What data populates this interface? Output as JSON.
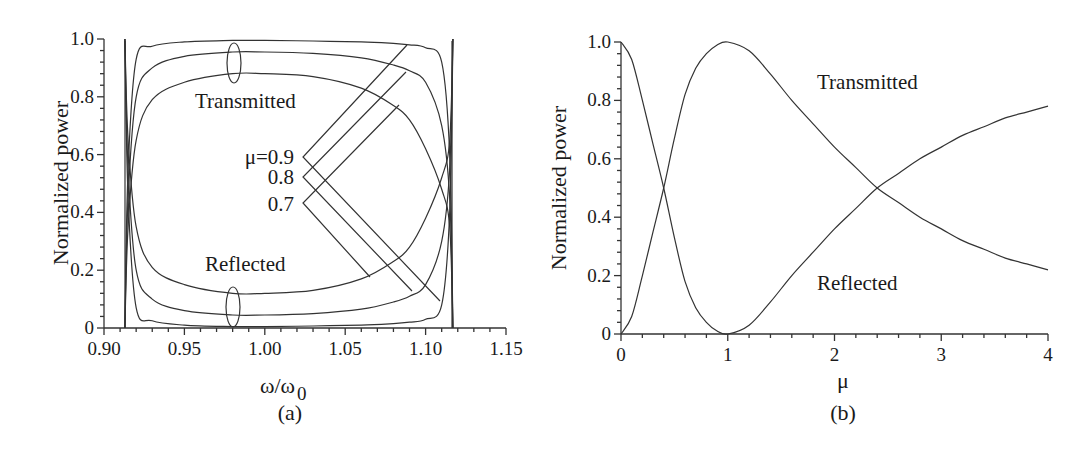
{
  "figure": {
    "panel_a": {
      "caption": "(a)",
      "ylabel": "Normalized power",
      "xlabel_main": "ω/ω",
      "xlabel_sub": "0",
      "xticks": [
        "0.90",
        "0.95",
        "1.00",
        "1.05",
        "1.10",
        "1.15"
      ],
      "yticks": [
        "0",
        "0.2",
        "0.4",
        "0.6",
        "0.8",
        "1.0"
      ],
      "annotations": {
        "transmitted": "Transmitted",
        "reflected": "Reflected",
        "mu_09": "μ=0.9",
        "mu_08": "0.8",
        "mu_07": "0.7"
      }
    },
    "panel_b": {
      "caption": "(b)",
      "ylabel": "Normalized power",
      "xlabel": "μ",
      "xticks": [
        "0",
        "1",
        "2",
        "3",
        "4"
      ],
      "yticks": [
        "0",
        "0.2",
        "0.4",
        "0.6",
        "0.8",
        "1.0"
      ],
      "annotations": {
        "transmitted": "Transmitted",
        "reflected": "Reflected"
      }
    }
  },
  "chart_data": [
    {
      "type": "line",
      "panel": "(a)",
      "title": "",
      "xlabel": "ω/ω0",
      "ylabel": "Normalized power",
      "xlim": [
        0.9,
        1.15
      ],
      "ylim": [
        0,
        1.0
      ],
      "grid": false,
      "x": [
        0.913,
        0.915,
        0.92,
        0.93,
        0.95,
        0.98,
        1.0,
        1.03,
        1.06,
        1.08,
        1.09,
        1.1,
        1.11,
        1.115,
        1.117
      ],
      "series": [
        {
          "name": "Transmitted μ=0.9",
          "values": [
            0.0,
            0.55,
            0.93,
            0.975,
            0.99,
            0.995,
            0.995,
            0.993,
            0.99,
            0.985,
            0.98,
            0.97,
            0.92,
            0.6,
            0.0
          ]
        },
        {
          "name": "Transmitted μ=0.8",
          "values": [
            0.0,
            0.45,
            0.8,
            0.9,
            0.94,
            0.955,
            0.955,
            0.95,
            0.935,
            0.91,
            0.89,
            0.85,
            0.7,
            0.45,
            0.0
          ]
        },
        {
          "name": "Transmitted μ=0.7",
          "values": [
            0.0,
            0.35,
            0.65,
            0.79,
            0.85,
            0.88,
            0.88,
            0.87,
            0.83,
            0.77,
            0.72,
            0.62,
            0.48,
            0.35,
            0.0
          ]
        },
        {
          "name": "Reflected μ=0.9",
          "values": [
            1.0,
            0.45,
            0.07,
            0.025,
            0.01,
            0.005,
            0.005,
            0.007,
            0.01,
            0.015,
            0.02,
            0.03,
            0.08,
            0.4,
            1.0
          ]
        },
        {
          "name": "Reflected μ=0.8",
          "values": [
            1.0,
            0.55,
            0.2,
            0.1,
            0.06,
            0.045,
            0.045,
            0.05,
            0.065,
            0.09,
            0.11,
            0.15,
            0.3,
            0.55,
            1.0
          ]
        },
        {
          "name": "Reflected μ=0.7",
          "values": [
            1.0,
            0.65,
            0.35,
            0.21,
            0.15,
            0.12,
            0.12,
            0.13,
            0.17,
            0.23,
            0.28,
            0.38,
            0.52,
            0.65,
            1.0
          ]
        }
      ],
      "annotations": [
        "Transmitted",
        "Reflected",
        "μ=0.9",
        "0.8",
        "0.7"
      ]
    },
    {
      "type": "line",
      "panel": "(b)",
      "title": "",
      "xlabel": "μ",
      "ylabel": "Normalized power",
      "xlim": [
        0,
        4
      ],
      "ylim": [
        0,
        1.0
      ],
      "grid": false,
      "x": [
        0,
        0.1,
        0.2,
        0.3,
        0.4,
        0.5,
        0.6,
        0.7,
        0.8,
        0.9,
        1.0,
        1.2,
        1.4,
        1.6,
        1.8,
        2.0,
        2.2,
        2.4,
        2.6,
        2.8,
        3.0,
        3.2,
        3.4,
        3.6,
        3.8,
        4.0
      ],
      "series": [
        {
          "name": "Transmitted",
          "values": [
            0.0,
            0.06,
            0.2,
            0.35,
            0.5,
            0.67,
            0.82,
            0.91,
            0.96,
            0.99,
            1.0,
            0.97,
            0.89,
            0.8,
            0.72,
            0.64,
            0.57,
            0.5,
            0.45,
            0.4,
            0.36,
            0.32,
            0.29,
            0.26,
            0.24,
            0.22
          ]
        },
        {
          "name": "Reflected",
          "values": [
            1.0,
            0.94,
            0.8,
            0.65,
            0.5,
            0.33,
            0.18,
            0.09,
            0.04,
            0.01,
            0.0,
            0.03,
            0.11,
            0.2,
            0.28,
            0.36,
            0.43,
            0.5,
            0.55,
            0.6,
            0.64,
            0.68,
            0.71,
            0.74,
            0.76,
            0.78
          ]
        }
      ],
      "annotations": [
        "Transmitted",
        "Reflected"
      ]
    }
  ]
}
